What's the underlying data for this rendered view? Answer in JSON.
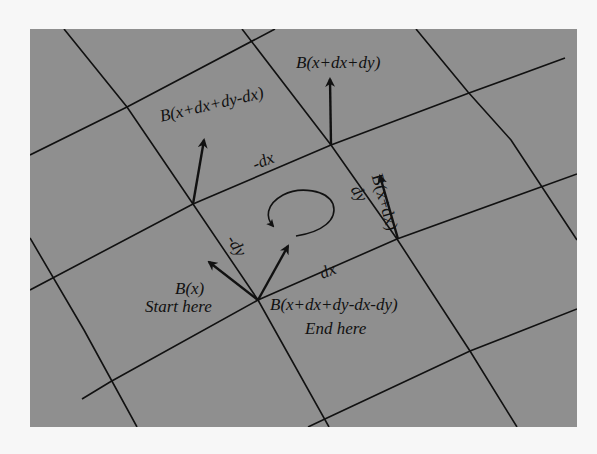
{
  "figure": {
    "background_color": "#8f8f8f",
    "page_color": "#f7f7f7",
    "line_color": "#111111"
  },
  "labels": {
    "b_x": "B(x)",
    "start_here": "Start here",
    "b_x_dx": "B(x+dx)",
    "b_x_dx_dy": "B(x+dx+dy)",
    "b_x_dx_dy_minus_dx": "B(x+dx+dy-dx)",
    "b_end": "B(x+dx+dy-dx-dy)",
    "end_here": "End here",
    "step_dx": "dx",
    "step_dy": "dy",
    "step_minus_dx": "-dx",
    "step_minus_dy": "-dy"
  },
  "icons": {
    "rotation_arrow": "counterclockwise-loop-arrow",
    "field_vectors": "arrow-up"
  }
}
